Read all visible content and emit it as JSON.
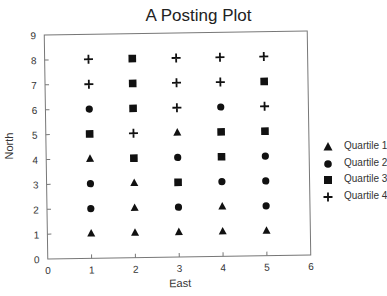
{
  "chart_data": {
    "type": "scatter",
    "title": "A Posting Plot",
    "xlabel": "East",
    "ylabel": "North",
    "xlim": [
      0,
      6
    ],
    "ylim": [
      0,
      9
    ],
    "xticks": [
      "0",
      "1",
      "2",
      "3",
      "4",
      "5",
      "6"
    ],
    "yticks": [
      "0",
      "1",
      "2",
      "3",
      "4",
      "5",
      "6",
      "7",
      "8",
      "9"
    ],
    "grid": false,
    "legend_position": "right",
    "legend": [
      {
        "label": "Quartile 1",
        "marker": "triangle"
      },
      {
        "label": "Quartile 2",
        "marker": "circle"
      },
      {
        "label": "Quartile 3",
        "marker": "square"
      },
      {
        "label": "Quartile 4",
        "marker": "plus"
      }
    ],
    "series": [
      {
        "name": "Quartile 1",
        "marker": "triangle",
        "points": [
          [
            1,
            1
          ],
          [
            2,
            1
          ],
          [
            3,
            1
          ],
          [
            4,
            1
          ],
          [
            5,
            1
          ],
          [
            2,
            2
          ],
          [
            4,
            2
          ],
          [
            2,
            3
          ],
          [
            1,
            4
          ],
          [
            3,
            5
          ]
        ]
      },
      {
        "name": "Quartile 2",
        "marker": "circle",
        "points": [
          [
            1,
            2
          ],
          [
            3,
            2
          ],
          [
            5,
            2
          ],
          [
            1,
            3
          ],
          [
            4,
            3
          ],
          [
            5,
            3
          ],
          [
            3,
            4
          ],
          [
            5,
            4
          ],
          [
            1,
            6
          ],
          [
            4,
            6
          ]
        ]
      },
      {
        "name": "Quartile 3",
        "marker": "square",
        "points": [
          [
            3,
            3
          ],
          [
            2,
            4
          ],
          [
            4,
            4
          ],
          [
            1,
            5
          ],
          [
            4,
            5
          ],
          [
            5,
            5
          ],
          [
            2,
            6
          ],
          [
            2,
            7
          ],
          [
            5,
            7
          ],
          [
            2,
            8
          ]
        ]
      },
      {
        "name": "Quartile 4",
        "marker": "plus",
        "points": [
          [
            2,
            5
          ],
          [
            3,
            6
          ],
          [
            5,
            6
          ],
          [
            1,
            7
          ],
          [
            3,
            7
          ],
          [
            4,
            7
          ],
          [
            1,
            8
          ],
          [
            3,
            8
          ],
          [
            4,
            8
          ],
          [
            5,
            8
          ]
        ]
      }
    ]
  }
}
